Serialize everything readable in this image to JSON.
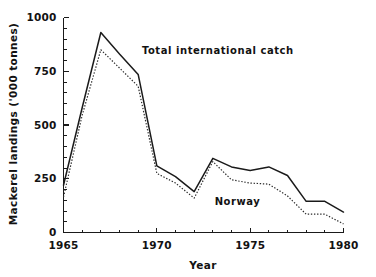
{
  "chart_data": {
    "type": "line",
    "title": "",
    "xlabel": "Year",
    "ylabel": "Mackerel landings ('000 tonnes)",
    "xlim": [
      1965,
      1980
    ],
    "ylim": [
      0,
      1000
    ],
    "grid": false,
    "legend_position": "inline-annotation",
    "x": [
      1965,
      1966,
      1967,
      1968,
      1969,
      1970,
      1971,
      1972,
      1973,
      1974,
      1975,
      1976,
      1977,
      1978,
      1979,
      1980
    ],
    "xticks": [
      "1965",
      "1970",
      "1975",
      "1980"
    ],
    "xtick_values": [
      1965,
      1970,
      1975,
      1980
    ],
    "xminor_step": 1,
    "yticks": [
      "0",
      "250",
      "500",
      "750",
      "1000"
    ],
    "ytick_values": [
      0,
      250,
      500,
      750,
      1000
    ],
    "yminor_step": 50,
    "series": [
      {
        "name": "Total international catch",
        "style": "solid",
        "color": "#1a1a1a",
        "label_x": 1969.2,
        "label_y": 830,
        "values": [
          220,
          580,
          930,
          830,
          735,
          310,
          260,
          190,
          345,
          305,
          288,
          305,
          265,
          145,
          145,
          95
        ]
      },
      {
        "name": "Norway",
        "style": "dotted",
        "color": "#2b2b2b",
        "label_x": 1973.1,
        "label_y": 130,
        "values": [
          165,
          545,
          850,
          765,
          680,
          275,
          230,
          160,
          330,
          245,
          230,
          225,
          170,
          85,
          85,
          40
        ]
      }
    ]
  },
  "annotations": {
    "total_catch_label": "Total international catch",
    "norway_label": "Norway"
  },
  "axes": {
    "x_title": "Year",
    "y_title": "Mackerel landings ('000 tonnes)",
    "x_tick_labels": [
      "1965",
      "1970",
      "1975",
      "1980"
    ],
    "y_tick_labels": [
      "0",
      "250",
      "500",
      "750",
      "1000"
    ]
  }
}
